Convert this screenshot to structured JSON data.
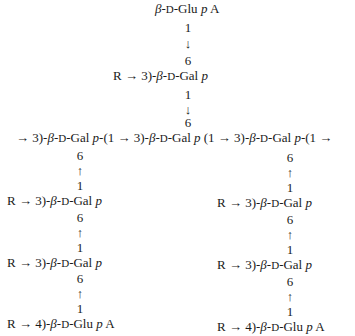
{
  "diagram": {
    "type": "polysaccharide-structure",
    "top_branch": {
      "terminal_residue": "β-D-Glu p A",
      "link_1": {
        "from": "1",
        "arrow": "↓",
        "to": "6"
      },
      "residue": "R → 3)-β-D-Gal p",
      "link_2": {
        "from": "1",
        "arrow": "↓",
        "to": "6"
      }
    },
    "main_chain": "→ 3)-β-D-Gal p-(1 → 3)-β-D-Gal p (1 → 3)-β-D-Gal p-(1 →",
    "left_branch": {
      "link_1": {
        "to": "6",
        "arrow": "↑",
        "from": "1"
      },
      "residue_1": "R → 3)-β-D-Gal p",
      "link_2": {
        "to": "6",
        "arrow": "↑",
        "from": "1"
      },
      "residue_2": "R → 3)-β-D-Gal p",
      "link_3": {
        "to": "6",
        "arrow": "↑",
        "from": "1"
      },
      "terminal_residue": "R → 4)-β-D-Glu p A"
    },
    "right_branch": {
      "link_1": {
        "to": "6",
        "arrow": "↑",
        "from": "1"
      },
      "residue_1": "R → 3)-β-D-Gal p",
      "link_2": {
        "to": "6",
        "arrow": "↑",
        "from": "1"
      },
      "residue_2": "R → 3)-β-D-Gal p",
      "link_3": {
        "to": "6",
        "arrow": "↑",
        "from": "1"
      },
      "terminal_residue": "R → 4)-β-D-Glu p A"
    }
  }
}
